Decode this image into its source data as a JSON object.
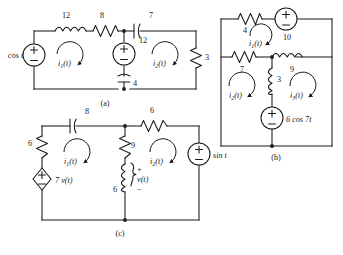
{
  "figure": {
    "background_color": "#ffffff",
    "ink_color": "#1a1a1a",
    "width": 343,
    "height": 255
  },
  "captions": {
    "a": "(a)",
    "b": "(b)",
    "c": "(c)"
  },
  "circuit_a": {
    "caption": "(a)",
    "sources": [
      {
        "name": "source-cos-t",
        "label": "cos t",
        "type": "independent-voltage-source",
        "plus": "+",
        "minus": "−"
      },
      {
        "name": "source-middle-12",
        "label": "12",
        "type": "independent-voltage-source",
        "plus": "+",
        "minus": "−"
      }
    ],
    "elements": [
      {
        "name": "inductor-12",
        "label": "12",
        "type": "inductor"
      },
      {
        "name": "resistor-8",
        "label": "8",
        "type": "resistor"
      },
      {
        "name": "capacitor-7",
        "label": "7",
        "type": "capacitor"
      },
      {
        "name": "capacitor-4",
        "label": "4",
        "type": "capacitor"
      },
      {
        "name": "resistor-3",
        "label": "3",
        "type": "resistor"
      }
    ],
    "mesh_currents": [
      {
        "name": "mesh-current-i1",
        "symbol": "i",
        "sub": "1",
        "suffix": "(t)"
      },
      {
        "name": "mesh-current-i2",
        "symbol": "i",
        "sub": "2",
        "suffix": "(t)"
      }
    ]
  },
  "circuit_b": {
    "caption": "(b)",
    "sources": [
      {
        "name": "source-10",
        "label": "10",
        "type": "independent-voltage-source",
        "plus": "+",
        "minus": "−"
      },
      {
        "name": "source-6cos7t",
        "label": "6 cos 7t",
        "type": "independent-voltage-source",
        "plus": "+",
        "minus": "−"
      }
    ],
    "elements": [
      {
        "name": "resistor-4",
        "label": "4",
        "type": "resistor"
      },
      {
        "name": "resistor-7",
        "label": "7",
        "type": "resistor"
      },
      {
        "name": "inductor-9",
        "label": "9",
        "type": "inductor"
      },
      {
        "name": "inductor-3",
        "label": "3",
        "type": "inductor"
      }
    ],
    "mesh_currents": [
      {
        "name": "mesh-current-i1",
        "symbol": "i",
        "sub": "1",
        "suffix": "(t)"
      },
      {
        "name": "mesh-current-i2",
        "symbol": "i",
        "sub": "2",
        "suffix": "(t)"
      },
      {
        "name": "mesh-current-i3",
        "symbol": "i",
        "sub": "3",
        "suffix": "(t)"
      }
    ]
  },
  "circuit_c": {
    "caption": "(c)",
    "sources": [
      {
        "name": "dependent-source-7vt",
        "label": "7 v(t)",
        "type": "dependent-voltage-source",
        "plus": "+",
        "minus": "−"
      },
      {
        "name": "source-sin-t",
        "label": "sin t",
        "type": "independent-voltage-source",
        "plus": "+",
        "minus": "−"
      }
    ],
    "elements": [
      {
        "name": "capacitor-8",
        "label": "8",
        "type": "capacitor"
      },
      {
        "name": "resistor-6-left",
        "label": "6",
        "type": "resistor"
      },
      {
        "name": "resistor-9",
        "label": "9",
        "type": "resistor"
      },
      {
        "name": "inductor-6",
        "label": "6",
        "type": "inductor"
      },
      {
        "name": "resistor-6-top",
        "label": "6",
        "type": "resistor"
      }
    ],
    "voltage_label": {
      "name": "voltage-vt",
      "label": "v(t)",
      "plus": "+",
      "minus": "−"
    },
    "mesh_currents": [
      {
        "name": "mesh-current-i1",
        "symbol": "i",
        "sub": "1",
        "suffix": "(t)"
      },
      {
        "name": "mesh-current-i2",
        "symbol": "i",
        "sub": "2",
        "suffix": "(t)"
      }
    ]
  }
}
